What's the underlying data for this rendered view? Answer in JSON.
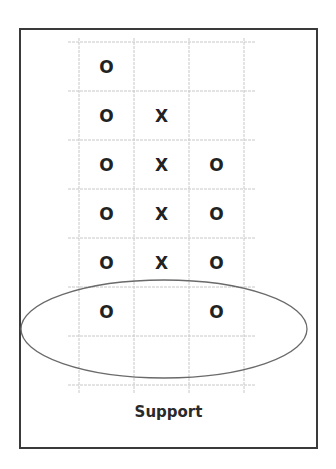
{
  "chart_data": {
    "type": "table",
    "subtype": "point-and-figure",
    "title": "",
    "caption": "Support",
    "columns": 3,
    "rows": 7,
    "column_markers": [
      {
        "column": 1,
        "marker": "O",
        "boxes_from_top": [
          1,
          2,
          3,
          4,
          5,
          6
        ]
      },
      {
        "column": 2,
        "marker": "X",
        "boxes_from_top": [
          2,
          3,
          4,
          5
        ]
      },
      {
        "column": 3,
        "marker": "O",
        "boxes_from_top": [
          3,
          4,
          5,
          6
        ]
      }
    ],
    "grid": [
      [
        "O",
        "",
        ""
      ],
      [
        "O",
        "X",
        ""
      ],
      [
        "O",
        "X",
        "O"
      ],
      [
        "O",
        "X",
        "O"
      ],
      [
        "O",
        "X",
        "O"
      ],
      [
        "O",
        "",
        "O"
      ],
      [
        "",
        "",
        ""
      ]
    ],
    "annotations": [
      {
        "type": "ellipse",
        "label": "support-level-highlight",
        "covers_rows_from_top": [
          6,
          7
        ],
        "note": "Both O columns bottom out at the same level"
      }
    ],
    "grid_on": true,
    "legend": null,
    "xlabel": "",
    "ylabel": ""
  },
  "colors": {
    "frame": "#3a3a3a",
    "gridline": "#c8c8c8",
    "marker": "#222222",
    "ellipse": "#6a6a6a",
    "caption": "#2a2a2a"
  },
  "caption": "Support"
}
